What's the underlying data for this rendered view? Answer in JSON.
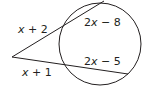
{
  "diagram": {
    "type": "secant-secant theorem figure",
    "colors": {
      "stroke": "#231f20",
      "background": "#ffffff"
    },
    "circle": {
      "cx": 100,
      "cy": 44,
      "r": 41
    },
    "vertex": {
      "x": 12,
      "y": 57
    },
    "secants": [
      {
        "name": "upper",
        "external_point": {
          "x": 62,
          "y": 26
        },
        "end_point": {
          "x": 104,
          "y": 1
        },
        "external_segment_label": {
          "var": "x",
          "rest": " + 2"
        },
        "internal_segment_label": {
          "coef": "2",
          "var": "x",
          "rest": " − 8"
        }
      },
      {
        "name": "lower",
        "external_point": {
          "x": 64,
          "y": 64
        },
        "end_point": {
          "x": 128,
          "y": 74
        },
        "external_segment_label": {
          "var": "x",
          "rest": " + 1"
        },
        "internal_segment_label": {
          "coef": "2",
          "var": "x",
          "rest": " − 5"
        }
      }
    ]
  }
}
